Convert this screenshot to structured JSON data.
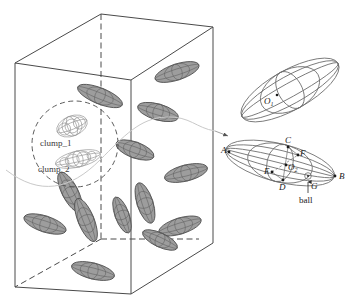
{
  "figure": {
    "type": "scientific-diagram"
  },
  "container": {
    "name": "rectangular-box",
    "edge_color": "#4a4a4a",
    "hidden_edge_style": "dashed"
  },
  "particles": {
    "fill_color": "#9a9a9a",
    "stroke_color": "#4a4a4a",
    "count": 13,
    "list": [
      {
        "cx": 177,
        "cy": 72,
        "rx": 23,
        "ry": 8,
        "rot": -18
      },
      {
        "cx": 100,
        "cy": 96,
        "rx": 24,
        "ry": 8,
        "rot": 22
      },
      {
        "cx": 158,
        "cy": 112,
        "rx": 21,
        "ry": 8,
        "rot": 16
      },
      {
        "cx": 186,
        "cy": 173,
        "rx": 22,
        "ry": 8,
        "rot": -14
      },
      {
        "cx": 70,
        "cy": 192,
        "rx": 22,
        "ry": 8,
        "rot": 63
      },
      {
        "cx": 145,
        "cy": 203,
        "rx": 21,
        "ry": 8,
        "rot": 72
      },
      {
        "cx": 86,
        "cy": 220,
        "rx": 23,
        "ry": 8,
        "rot": 68
      },
      {
        "cx": 45,
        "cy": 224,
        "rx": 22,
        "ry": 8,
        "rot": 18
      },
      {
        "cx": 180,
        "cy": 226,
        "rx": 22,
        "ry": 8,
        "rot": -17
      },
      {
        "cx": 93,
        "cy": 271,
        "rx": 22,
        "ry": 8,
        "rot": 14
      },
      {
        "cx": 135,
        "cy": 150,
        "rx": 20,
        "ry": 8,
        "rot": 20
      },
      {
        "cx": 122,
        "cy": 215,
        "rx": 19,
        "ry": 7,
        "rot": 70
      },
      {
        "cx": 160,
        "cy": 240,
        "rx": 19,
        "ry": 7,
        "rot": 25
      }
    ]
  },
  "clump_annotation": {
    "circle_label": "dashed-circle",
    "clump_1_label": "clump_1",
    "clump_2_label": "clump_2"
  },
  "magnified": {
    "upper_ellipsoid": {
      "name": "upper-ellipsoid",
      "center_label": "O",
      "center_subscript": "1"
    },
    "lower_ellipsoid": {
      "name": "lower-ellipsoid",
      "center_label": "O",
      "center_subscript": "2",
      "vertices": [
        {
          "id": "A",
          "label": "A",
          "x": 76,
          "y": 17
        },
        {
          "id": "B",
          "label": "B",
          "x": 283,
          "y": 98
        },
        {
          "id": "C",
          "label": "C",
          "x": 188,
          "y": 5
        },
        {
          "id": "D",
          "label": "D",
          "x": 167,
          "y": 112
        },
        {
          "id": "E",
          "label": "E",
          "x": 150,
          "y": 77
        },
        {
          "id": "F",
          "label": "F",
          "x": 202,
          "y": 29
        },
        {
          "id": "G",
          "label": "G",
          "x": 218,
          "y": 110
        }
      ],
      "ball_label": "ball"
    }
  },
  "leader": {
    "name": "zoom-leader-curve",
    "color": "#c4c4c4",
    "arrow": true
  }
}
